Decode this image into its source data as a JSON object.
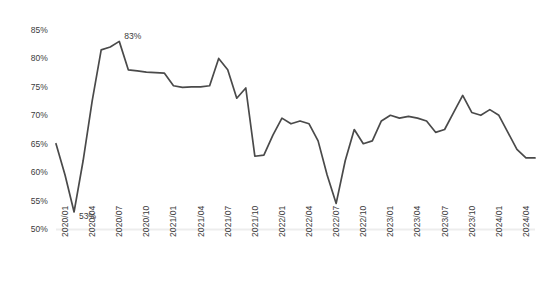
{
  "chart_data": {
    "type": "line",
    "title": "",
    "subtitle": "",
    "xlabel": "",
    "ylabel": "",
    "ylim": [
      50,
      85
    ],
    "ytick_values": [
      50,
      55,
      60,
      65,
      70,
      75,
      80,
      85
    ],
    "ytick_labels": [
      "50%",
      "55%",
      "60%",
      "65%",
      "70%",
      "75%",
      "80%",
      "85%"
    ],
    "grid": false,
    "legend": false,
    "legend_position": "none",
    "value_suffix": "%",
    "line_color": "#4a4a4a",
    "axis_color": "#ededed",
    "xtick_labels": [
      "2020/01",
      "2020/04",
      "2020/07",
      "2020/10",
      "2021/01",
      "2021/04",
      "2021/07",
      "2021/10",
      "2022/01",
      "2022/04",
      "2022/07",
      "2022/10",
      "2023/01",
      "2023/04",
      "2023/07",
      "2023/10",
      "2024/01",
      "2024/04"
    ],
    "x": [
      "2020/01",
      "2020/02",
      "2020/03",
      "2020/04",
      "2020/05",
      "2020/06",
      "2020/07",
      "2020/08",
      "2020/09",
      "2020/10",
      "2020/11",
      "2020/12",
      "2021/01",
      "2021/02",
      "2021/03",
      "2021/04",
      "2021/05",
      "2021/06",
      "2021/07",
      "2021/08",
      "2021/09",
      "2021/10",
      "2021/11",
      "2021/12",
      "2022/01",
      "2022/02",
      "2022/03",
      "2022/04",
      "2022/05",
      "2022/06",
      "2022/07",
      "2022/08",
      "2022/09",
      "2022/10",
      "2022/11",
      "2022/12",
      "2023/01",
      "2023/02",
      "2023/03",
      "2023/04",
      "2023/05",
      "2023/06",
      "2023/07",
      "2023/08",
      "2023/09",
      "2023/10",
      "2023/11",
      "2023/12",
      "2024/01",
      "2024/02",
      "2024/03",
      "2024/04",
      "2024/05",
      "2024/06"
    ],
    "values": [
      65.0,
      59.5,
      53.0,
      62.0,
      72.5,
      81.5,
      82.0,
      83.0,
      78.0,
      77.8,
      77.6,
      77.5,
      77.4,
      75.2,
      74.9,
      75.0,
      75.0,
      75.2,
      80.0,
      78.0,
      73.0,
      74.8,
      62.8,
      63.0,
      66.5,
      69.5,
      68.5,
      69.0,
      68.5,
      65.5,
      59.5,
      54.5,
      62.0,
      67.5,
      65.0,
      65.5,
      69.0,
      70.0,
      69.5,
      69.8,
      69.5,
      69.0,
      67.0,
      67.5,
      70.5,
      73.5,
      70.5,
      70.0,
      71.0,
      70.0,
      67.0,
      64.0,
      62.5,
      62.5
    ],
    "annotations": [
      {
        "label": "83%",
        "x": "2020/08",
        "value": 83.0
      },
      {
        "label": "53%",
        "x": "2020/03",
        "value": 53.0
      }
    ]
  }
}
